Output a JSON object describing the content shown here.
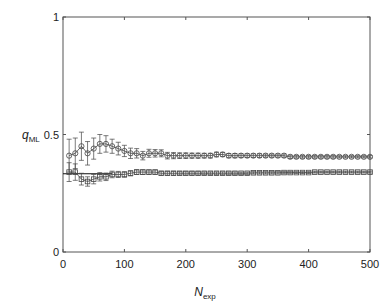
{
  "chart_data": {
    "type": "scatter",
    "title": "",
    "xlabel": "N",
    "xlabel_sub": "exp",
    "ylabel": "q",
    "ylabel_sub": "ML",
    "xlim": [
      0,
      500
    ],
    "ylim": [
      0,
      1
    ],
    "xticks": [
      0,
      100,
      200,
      300,
      400,
      500
    ],
    "xtick_labels": [
      "0",
      "100",
      "200",
      "300",
      "400",
      "500"
    ],
    "yticks": [
      0,
      0.5,
      1
    ],
    "ytick_labels": [
      "0",
      "0.5",
      "1"
    ],
    "grid": false,
    "legend": null,
    "reference_line": {
      "y": 0.333,
      "x_range": [
        0,
        80
      ],
      "style": "solid"
    },
    "x": [
      10,
      20,
      30,
      40,
      50,
      60,
      70,
      80,
      90,
      100,
      110,
      120,
      130,
      140,
      150,
      160,
      170,
      180,
      190,
      200,
      210,
      220,
      230,
      240,
      250,
      260,
      270,
      280,
      290,
      300,
      310,
      320,
      330,
      340,
      350,
      360,
      370,
      380,
      390,
      400,
      410,
      420,
      430,
      440,
      450,
      460,
      470,
      480,
      490,
      500
    ],
    "series": [
      {
        "name": "circles (upper estimate)",
        "marker": "circle",
        "values": [
          0.41,
          0.42,
          0.45,
          0.42,
          0.44,
          0.46,
          0.46,
          0.45,
          0.44,
          0.43,
          0.42,
          0.42,
          0.41,
          0.42,
          0.42,
          0.42,
          0.41,
          0.41,
          0.41,
          0.41,
          0.41,
          0.41,
          0.41,
          0.41,
          0.415,
          0.415,
          0.41,
          0.41,
          0.41,
          0.41,
          0.41,
          0.41,
          0.41,
          0.41,
          0.41,
          0.41,
          0.405,
          0.405,
          0.405,
          0.405,
          0.405,
          0.405,
          0.405,
          0.405,
          0.405,
          0.405,
          0.405,
          0.405,
          0.405,
          0.405
        ],
        "errors": [
          0.07,
          0.065,
          0.06,
          0.05,
          0.045,
          0.04,
          0.035,
          0.03,
          0.027,
          0.024,
          0.022,
          0.02,
          0.018,
          0.017,
          0.016,
          0.015,
          0.014,
          0.013,
          0.012,
          0.012,
          0.011,
          0.011,
          0.01,
          0.01,
          0.01,
          0.009,
          0.009,
          0.009,
          0.008,
          0.008,
          0.008,
          0.008,
          0.007,
          0.007,
          0.007,
          0.007,
          0.007,
          0.006,
          0.006,
          0.006,
          0.006,
          0.006,
          0.006,
          0.006,
          0.005,
          0.005,
          0.005,
          0.005,
          0.005,
          0.005
        ]
      },
      {
        "name": "squares (lower estimate)",
        "marker": "square",
        "values": [
          0.34,
          0.34,
          0.31,
          0.3,
          0.31,
          0.32,
          0.32,
          0.33,
          0.33,
          0.33,
          0.335,
          0.34,
          0.34,
          0.34,
          0.34,
          0.335,
          0.335,
          0.335,
          0.335,
          0.335,
          0.335,
          0.335,
          0.335,
          0.335,
          0.335,
          0.335,
          0.335,
          0.335,
          0.335,
          0.335,
          0.337,
          0.337,
          0.337,
          0.337,
          0.337,
          0.338,
          0.338,
          0.338,
          0.338,
          0.338,
          0.34,
          0.34,
          0.34,
          0.34,
          0.34,
          0.34,
          0.34,
          0.34,
          0.34,
          0.34
        ],
        "errors": [
          0.04,
          0.035,
          0.025,
          0.02,
          0.02,
          0.018,
          0.016,
          0.014,
          0.013,
          0.012,
          0.011,
          0.01,
          0.01,
          0.009,
          0.009,
          0.008,
          0.008,
          0.008,
          0.007,
          0.007,
          0.007,
          0.007,
          0.006,
          0.006,
          0.006,
          0.006,
          0.006,
          0.006,
          0.005,
          0.005,
          0.005,
          0.005,
          0.005,
          0.005,
          0.005,
          0.005,
          0.005,
          0.004,
          0.004,
          0.004,
          0.004,
          0.004,
          0.004,
          0.004,
          0.004,
          0.004,
          0.004,
          0.004,
          0.004,
          0.004
        ]
      }
    ]
  },
  "plot_area": {
    "left": 63,
    "top": 17,
    "right": 370,
    "bottom": 252
  },
  "colors": {
    "axis": "#555555",
    "marker": "#444444",
    "text": "#222222"
  }
}
